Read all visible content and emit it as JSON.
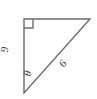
{
  "figure": {
    "type": "right-triangle-diagram",
    "background_color": "#ffffff",
    "stroke_color": "#6b6b6b",
    "text_color": "#3a3a3a"
  },
  "labels": {
    "vertical_leg": "9",
    "hypotenuse": "6",
    "angle": "θ"
  },
  "geometry": {
    "vertices": {
      "top_left": "24,19",
      "top_right": "90,19",
      "bottom_left": "24,93"
    },
    "right_angle_marker_vertex": "top_left",
    "right_angle_marker_size": "9"
  }
}
